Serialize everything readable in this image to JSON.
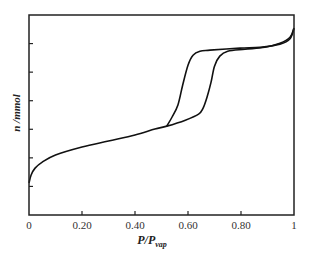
{
  "chart_data": {
    "type": "line",
    "title": "",
    "xlabel": "P/P",
    "xlabel_subscript": "vap",
    "ylabel": "n /mmol",
    "xlim": [
      0,
      1
    ],
    "ylim": [
      0,
      7
    ],
    "x_ticks": [
      0,
      0.2,
      0.4,
      0.6,
      0.8,
      1
    ],
    "x_tick_labels": [
      "0",
      "0.20",
      "0.40",
      "0.60",
      "0.80",
      "1"
    ],
    "y_ticks": [
      1,
      2,
      3,
      4,
      5,
      6
    ],
    "y_tick_labels": [
      "",
      "",
      "",
      "",
      "",
      ""
    ],
    "grid": false,
    "legend": "none",
    "series": [
      {
        "name": "adsorption",
        "color": "#111111",
        "points": [
          [
            0.0,
            1.12
          ],
          [
            0.008,
            1.4
          ],
          [
            0.023,
            1.64
          ],
          [
            0.05,
            1.85
          ],
          [
            0.1,
            2.1
          ],
          [
            0.2,
            2.38
          ],
          [
            0.3,
            2.59
          ],
          [
            0.4,
            2.8
          ],
          [
            0.475,
            3.01
          ],
          [
            0.52,
            3.11
          ],
          [
            0.59,
            3.32
          ],
          [
            0.64,
            3.53
          ],
          [
            0.657,
            3.74
          ],
          [
            0.672,
            4.13
          ],
          [
            0.687,
            4.65
          ],
          [
            0.7,
            5.21
          ],
          [
            0.72,
            5.56
          ],
          [
            0.75,
            5.73
          ],
          [
            0.815,
            5.8
          ],
          [
            0.89,
            5.87
          ],
          [
            0.947,
            6.01
          ],
          [
            0.985,
            6.22
          ],
          [
            1.0,
            6.54
          ]
        ]
      },
      {
        "name": "desorption",
        "color": "#111111",
        "points": [
          [
            1.0,
            6.54
          ],
          [
            0.985,
            6.17
          ],
          [
            0.947,
            5.98
          ],
          [
            0.872,
            5.87
          ],
          [
            0.796,
            5.84
          ],
          [
            0.683,
            5.77
          ],
          [
            0.645,
            5.73
          ],
          [
            0.619,
            5.59
          ],
          [
            0.6,
            5.24
          ],
          [
            0.58,
            4.55
          ],
          [
            0.562,
            3.85
          ],
          [
            0.54,
            3.43
          ],
          [
            0.52,
            3.11
          ]
        ]
      }
    ]
  }
}
